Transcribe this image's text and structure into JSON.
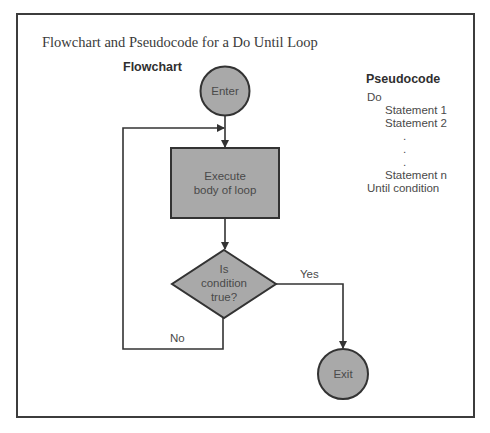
{
  "title": "Flowchart and Pseudocode for a Do Until Loop",
  "flowchart": {
    "heading": "Flowchart",
    "nodes": {
      "enter": "Enter",
      "process_line1": "Execute",
      "process_line2": "body of loop",
      "decision_line1": "Is",
      "decision_line2": "condition",
      "decision_line3": "true?",
      "exit": "Exit"
    },
    "edges": {
      "yes": "Yes",
      "no": "No"
    },
    "colors": {
      "shape_fill": "#a9a9a9",
      "stroke": "#333333"
    }
  },
  "pseudocode": {
    "heading": "Pseudocode",
    "lines": [
      "Do",
      "Statement 1",
      "Statement 2",
      ".",
      ".",
      ".",
      "Statement n",
      "Until condition"
    ]
  }
}
